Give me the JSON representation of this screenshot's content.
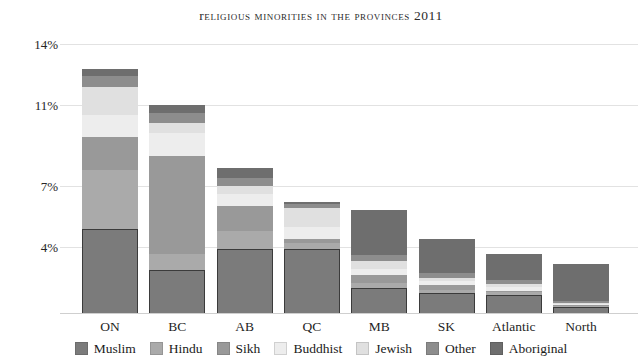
{
  "chart_data": {
    "type": "bar",
    "subtype": "stacked-bar",
    "title": "Religious Minorities in the Provinces 2011",
    "xlabel": "",
    "ylabel": "",
    "ylim": [
      0,
      14
    ],
    "grid": true,
    "legend_position": "bottom",
    "ytick_labels": [
      "14%",
      "11%",
      "7%",
      "4%"
    ],
    "ytick_values": [
      14,
      11,
      7,
      4
    ],
    "categories": [
      "ON",
      "BC",
      "AB",
      "QC",
      "MB",
      "SK",
      "Atlantic",
      "North"
    ],
    "series": [
      {
        "name": "Muslim",
        "color": "#7b7b7b",
        "values": [
          4.9,
          2.6,
          3.9,
          3.85,
          1.5,
          1.2,
          1.1,
          0.35
        ]
      },
      {
        "name": "Hindu",
        "color": "#aaaaaa",
        "values": [
          2.9,
          1.0,
          0.9,
          0.35,
          0.3,
          0.2,
          0.15,
          0.08
        ]
      },
      {
        "name": "Sikh",
        "color": "#999999",
        "values": [
          1.6,
          4.9,
          1.2,
          0.2,
          0.5,
          0.3,
          0.1,
          0.05
        ]
      },
      {
        "name": "Buddhist",
        "color": "#ededed",
        "values": [
          1.1,
          1.1,
          0.6,
          0.6,
          0.35,
          0.25,
          0.2,
          0.1
        ]
      },
      {
        "name": "Jewish",
        "color": "#e0e0e0",
        "values": [
          1.4,
          0.5,
          0.4,
          0.9,
          0.5,
          0.15,
          0.2,
          0.05
        ]
      },
      {
        "name": "Other",
        "color": "#8d8d8d",
        "values": [
          0.5,
          0.5,
          0.4,
          0.2,
          0.35,
          0.3,
          0.25,
          0.12
        ]
      },
      {
        "name": "Aboriginal",
        "color": "#6e6e6e",
        "values": [
          0.35,
          0.4,
          0.5,
          0.1,
          2.3,
          2.0,
          1.6,
          2.2
        ]
      }
    ],
    "totals": [
      12.75,
      11.0,
      7.9,
      6.2,
      5.8,
      4.4,
      3.6,
      2.95
    ]
  },
  "legend": {
    "items": [
      {
        "label": "Muslim",
        "color": "#7b7b7b"
      },
      {
        "label": "Hindu",
        "color": "#aaaaaa"
      },
      {
        "label": "Sikh",
        "color": "#999999"
      },
      {
        "label": "Buddhist",
        "color": "#ededed"
      },
      {
        "label": "Jewish",
        "color": "#e0e0e0"
      },
      {
        "label": "Other",
        "color": "#8d8d8d"
      },
      {
        "label": "Aboriginal",
        "color": "#6e6e6e"
      }
    ]
  },
  "colors": {
    "background": "#ffffff",
    "gridline": "#e2e2e2",
    "baseline": "#cfcfcf",
    "text": "#1f1f1f"
  }
}
